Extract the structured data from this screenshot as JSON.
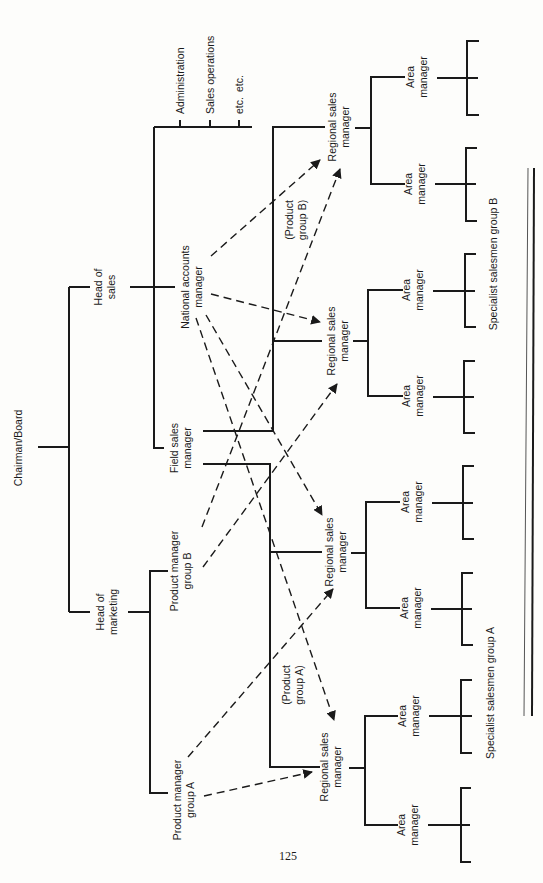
{
  "diagram": {
    "orientation": "rotated 90 degrees counter-clockwise",
    "top": {
      "label": "Chairman/Board"
    },
    "heads": {
      "sales": {
        "label_line1": "Head of",
        "label_line2": "sales"
      },
      "marketing": {
        "label_line1": "Head of",
        "label_line2": "marketing"
      }
    },
    "sales_staff": {
      "administration": "Administration",
      "sales_operations": "Sales operations",
      "etc1": "etc.",
      "etc2": "etc."
    },
    "national_accounts": {
      "line1": "National accounts",
      "line2": "manager"
    },
    "field_sales": {
      "line1": "Field sales",
      "line2": "manager"
    },
    "product_managers": {
      "b": {
        "line1": "Product manager",
        "line2": "group B"
      },
      "a": {
        "line1": "Product manager",
        "line2": "group A"
      }
    },
    "regional_sales_managers": [
      {
        "line1": "Regional sales",
        "line2": "manager"
      },
      {
        "line1": "Regional sales",
        "line2": "manager"
      },
      {
        "line1": "Regional sales",
        "line2": "manager"
      },
      {
        "line1": "Regional sales",
        "line2": "manager"
      }
    ],
    "area_managers": [
      {
        "line1": "Area",
        "line2": "manager"
      },
      {
        "line1": "Area",
        "line2": "manager"
      },
      {
        "line1": "Area",
        "line2": "manager"
      },
      {
        "line1": "Area",
        "line2": "manager"
      },
      {
        "line1": "Area",
        "line2": "manager"
      },
      {
        "line1": "Area",
        "line2": "manager"
      },
      {
        "line1": "Area",
        "line2": "manager"
      },
      {
        "line1": "Area",
        "line2": "manager"
      }
    ],
    "annotations": {
      "product_group_b": {
        "line1": "(Product",
        "line2": "group B)"
      },
      "product_group_a": {
        "line1": "(Product",
        "line2": "group A)"
      }
    },
    "groups": {
      "specialist_b": "Specialist salesmen group B",
      "specialist_a": "Specialist salesmen group A"
    },
    "dotted_relationships": [
      {
        "from": "National accounts manager",
        "to": "Regional sales manager (1)"
      },
      {
        "from": "National accounts manager",
        "to": "Regional sales manager (2)"
      },
      {
        "from": "National accounts manager",
        "to": "Regional sales manager (3)"
      },
      {
        "from": "National accounts manager",
        "to": "Regional sales manager (4)"
      },
      {
        "from": "Product manager group B",
        "to": "Regional sales manager (1)"
      },
      {
        "from": "Product manager group B",
        "to": "Regional sales manager (2)"
      },
      {
        "from": "Product manager group A",
        "to": "Regional sales manager (3)"
      },
      {
        "from": "Product manager group A",
        "to": "Regional sales manager (4)"
      }
    ]
  },
  "page": {
    "number": "125"
  }
}
